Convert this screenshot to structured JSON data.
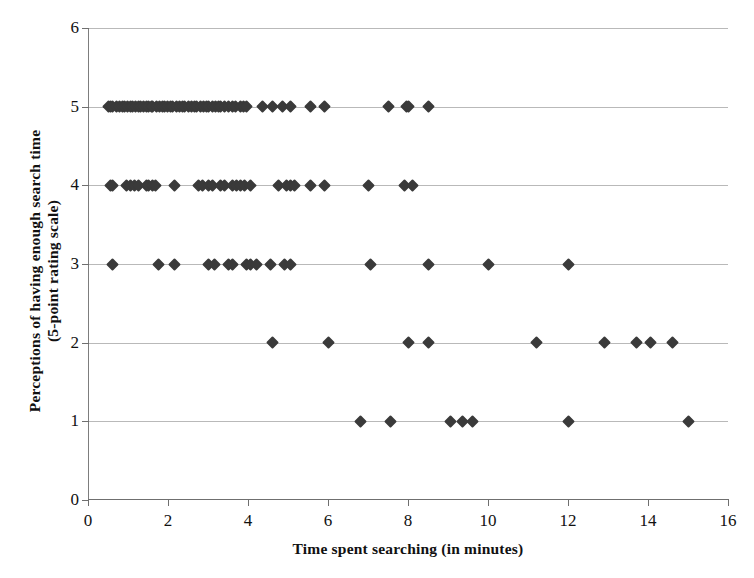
{
  "chart_data": {
    "type": "scatter",
    "title": "",
    "xlabel": "Time spent searching (in minutes)",
    "ylabel_line1": "Perceptions of having enough search time",
    "ylabel_line2": "(5-point rating scale)",
    "xlim": [
      0,
      16
    ],
    "ylim": [
      0,
      6
    ],
    "xticks": [
      0,
      2,
      4,
      6,
      8,
      10,
      12,
      14,
      16
    ],
    "yticks": [
      0,
      1,
      2,
      3,
      4,
      5,
      6
    ],
    "xtick_labels": [
      "0",
      "2",
      "4",
      "6",
      "8",
      "10",
      "12",
      "14",
      "16"
    ],
    "ytick_labels": [
      "0",
      "1",
      "2",
      "3",
      "4",
      "5",
      "6"
    ],
    "grid": "horizontal",
    "legend": "none",
    "marker": "filled-diamond",
    "marker_color": "#3a3a3a",
    "series": [
      {
        "name": "Respondents",
        "points": [
          [
            0.5,
            5
          ],
          [
            0.55,
            5
          ],
          [
            0.62,
            5
          ],
          [
            0.7,
            5
          ],
          [
            0.78,
            5
          ],
          [
            0.85,
            5
          ],
          [
            0.9,
            5
          ],
          [
            0.98,
            5
          ],
          [
            1.05,
            5
          ],
          [
            1.1,
            5
          ],
          [
            1.18,
            5
          ],
          [
            1.25,
            5
          ],
          [
            1.3,
            5
          ],
          [
            1.38,
            5
          ],
          [
            1.45,
            5
          ],
          [
            1.5,
            5
          ],
          [
            1.58,
            5
          ],
          [
            1.62,
            5
          ],
          [
            1.7,
            5
          ],
          [
            1.78,
            5
          ],
          [
            1.85,
            5
          ],
          [
            1.9,
            5
          ],
          [
            1.98,
            5
          ],
          [
            2.05,
            5
          ],
          [
            2.12,
            5
          ],
          [
            2.2,
            5
          ],
          [
            2.28,
            5
          ],
          [
            2.35,
            5
          ],
          [
            2.42,
            5
          ],
          [
            2.5,
            5
          ],
          [
            2.58,
            5
          ],
          [
            2.65,
            5
          ],
          [
            2.72,
            5
          ],
          [
            2.8,
            5
          ],
          [
            2.88,
            5
          ],
          [
            2.95,
            5
          ],
          [
            3.02,
            5
          ],
          [
            3.1,
            5
          ],
          [
            3.18,
            5
          ],
          [
            3.25,
            5
          ],
          [
            3.3,
            5
          ],
          [
            3.4,
            5
          ],
          [
            3.5,
            5
          ],
          [
            3.6,
            5
          ],
          [
            3.68,
            5
          ],
          [
            3.8,
            5
          ],
          [
            3.88,
            5
          ],
          [
            3.95,
            5
          ],
          [
            4.35,
            5
          ],
          [
            4.6,
            5
          ],
          [
            4.85,
            5
          ],
          [
            5.05,
            5
          ],
          [
            5.55,
            5
          ],
          [
            5.9,
            5
          ],
          [
            7.5,
            5
          ],
          [
            7.95,
            5
          ],
          [
            8.0,
            5
          ],
          [
            8.5,
            5
          ],
          [
            0.55,
            4
          ],
          [
            0.62,
            4
          ],
          [
            0.95,
            4
          ],
          [
            1.05,
            4
          ],
          [
            1.15,
            4
          ],
          [
            1.25,
            4
          ],
          [
            1.45,
            4
          ],
          [
            1.52,
            4
          ],
          [
            1.6,
            4
          ],
          [
            1.68,
            4
          ],
          [
            2.15,
            4
          ],
          [
            2.75,
            4
          ],
          [
            2.85,
            4
          ],
          [
            3.0,
            4
          ],
          [
            3.1,
            4
          ],
          [
            3.3,
            4
          ],
          [
            3.4,
            4
          ],
          [
            3.6,
            4
          ],
          [
            3.7,
            4
          ],
          [
            3.8,
            4
          ],
          [
            3.92,
            4
          ],
          [
            4.05,
            4
          ],
          [
            4.75,
            4
          ],
          [
            4.95,
            4
          ],
          [
            5.05,
            4
          ],
          [
            5.15,
            4
          ],
          [
            5.55,
            4
          ],
          [
            5.9,
            4
          ],
          [
            7.0,
            4
          ],
          [
            7.9,
            4
          ],
          [
            8.1,
            4
          ],
          [
            0.6,
            3
          ],
          [
            1.75,
            3
          ],
          [
            2.15,
            3
          ],
          [
            3.0,
            3
          ],
          [
            3.15,
            3
          ],
          [
            3.5,
            3
          ],
          [
            3.6,
            3
          ],
          [
            3.95,
            3
          ],
          [
            4.05,
            3
          ],
          [
            4.2,
            3
          ],
          [
            4.55,
            3
          ],
          [
            4.9,
            3
          ],
          [
            5.05,
            3
          ],
          [
            7.05,
            3
          ],
          [
            8.5,
            3
          ],
          [
            10.0,
            3
          ],
          [
            12.0,
            3
          ],
          [
            4.6,
            2
          ],
          [
            6.0,
            2
          ],
          [
            8.0,
            2
          ],
          [
            8.5,
            2
          ],
          [
            11.2,
            2
          ],
          [
            12.9,
            2
          ],
          [
            13.7,
            2
          ],
          [
            14.05,
            2
          ],
          [
            14.6,
            2
          ],
          [
            6.8,
            1
          ],
          [
            7.55,
            1
          ],
          [
            9.05,
            1
          ],
          [
            9.35,
            1
          ],
          [
            9.6,
            1
          ],
          [
            12.0,
            1
          ],
          [
            15.0,
            1
          ]
        ]
      }
    ]
  },
  "icons": {
    "marker": "diamond-marker"
  }
}
